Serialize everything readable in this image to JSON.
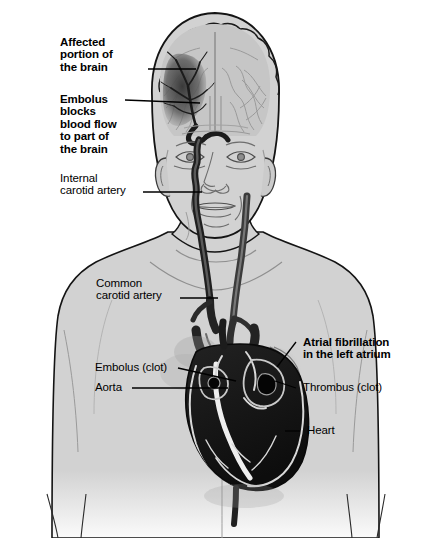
{
  "figure": {
    "kind": "medical-illustration",
    "background_color": "#ffffff",
    "skin_color": "#d2d2d2",
    "vessel_color": "#2b2b2b",
    "heart_color": "#1a1a1a",
    "outline_color": "#111111",
    "brain_color": "#c3c3c3",
    "infarct_color": "#4a4a4a",
    "label_color": "#000000"
  },
  "labels": [
    {
      "id": "affected-brain",
      "text": "Affected\nportion of\nthe brain",
      "bold": true,
      "x": 60,
      "y": 36,
      "leader": {
        "x1": 148,
        "y1": 69,
        "x2": 196,
        "y2": 69
      }
    },
    {
      "id": "embolus-blocks",
      "text": "Embolus\nblocks\nblood flow\nto part of\nthe brain",
      "bold": true,
      "x": 60,
      "y": 93,
      "leader": {
        "x1": 125,
        "y1": 100,
        "x2": 200,
        "y2": 103
      }
    },
    {
      "id": "internal-carotid",
      "text": "Internal\ncarotid artery",
      "bold": false,
      "x": 60,
      "y": 172,
      "leader": {
        "x1": 143,
        "y1": 192,
        "x2": 202,
        "y2": 192
      }
    },
    {
      "id": "common-carotid",
      "text": "Common\ncarotid artery",
      "bold": false,
      "x": 96,
      "y": 277,
      "leader": {
        "x1": 180,
        "y1": 298,
        "x2": 218,
        "y2": 298
      }
    },
    {
      "id": "embolus-clot",
      "text": "Embolus (clot)",
      "bold": false,
      "x": 95,
      "y": 361,
      "leader": {
        "x1": 178,
        "y1": 368,
        "x2": 236,
        "y2": 381
      }
    },
    {
      "id": "aorta",
      "text": "Aorta",
      "bold": false,
      "x": 95,
      "y": 381,
      "leader": {
        "x1": 132,
        "y1": 388,
        "x2": 228,
        "y2": 388
      }
    },
    {
      "id": "atrial-fibrillation",
      "text": "Atrial fibrillation\nin the left atrium",
      "bold": true,
      "x": 303,
      "y": 336,
      "leader": {
        "x1": 296,
        "y1": 342,
        "x2": 277,
        "y2": 367
      }
    },
    {
      "id": "thrombus-clot",
      "text": "Thrombus (clot)",
      "bold": false,
      "x": 303,
      "y": 381,
      "leader": {
        "x1": 296,
        "y1": 388,
        "x2": 275,
        "y2": 381
      }
    },
    {
      "id": "heart",
      "text": "Heart",
      "bold": false,
      "x": 307,
      "y": 424,
      "leader": {
        "x1": 300,
        "y1": 431,
        "x2": 285,
        "y2": 431
      }
    }
  ]
}
